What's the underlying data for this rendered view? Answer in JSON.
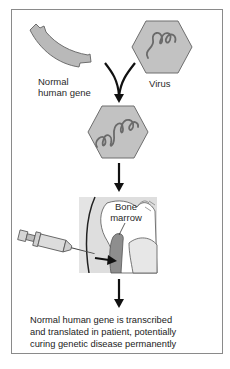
{
  "diagram": {
    "title": "",
    "nodes": {
      "gene": {
        "label_line1": "Normal",
        "label_line2": "human gene",
        "icon": "gene-segment"
      },
      "virus": {
        "label": "Virus",
        "icon": "virus-hexagon"
      },
      "recombinant_virus": {
        "icon": "virus-hexagon-with-gene"
      },
      "bone_marrow": {
        "label_line1": "Bone",
        "label_line2": "marrow",
        "icon": "bone-cross-section"
      },
      "syringe": {
        "icon": "syringe"
      },
      "outcome": {
        "line1": "Normal human gene is transcribed",
        "line2": "and translated in patient, potentially",
        "line3": "curing genetic disease permanently"
      }
    },
    "edges": [
      {
        "from": "gene",
        "to": "recombinant_virus",
        "type": "merge-arrow"
      },
      {
        "from": "virus",
        "to": "recombinant_virus",
        "type": "merge-arrow"
      },
      {
        "from": "recombinant_virus",
        "to": "bone_marrow",
        "type": "arrow-down"
      },
      {
        "from": "syringe",
        "to": "bone_marrow",
        "type": "arrow-right"
      },
      {
        "from": "bone_marrow",
        "to": "outcome",
        "type": "arrow-down"
      }
    ],
    "colors": {
      "shape_fill": "#b9b9b9",
      "shape_stroke": "#6e6e6e",
      "marrow_fill": "#8e8e8e",
      "arrow": "#111111",
      "frame": "#8a8a8a"
    }
  }
}
